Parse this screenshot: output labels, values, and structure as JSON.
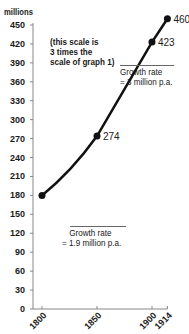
{
  "chart_data": {
    "type": "line",
    "title": "",
    "ylabel": "millions",
    "xlabel": "",
    "ylim": [
      0,
      460
    ],
    "yticks": [
      0,
      30,
      60,
      90,
      120,
      150,
      180,
      210,
      240,
      270,
      300,
      330,
      360,
      390,
      420,
      450
    ],
    "xticks": [
      "1800",
      "1850",
      "1900",
      "1914"
    ],
    "x": [
      1800,
      1850,
      1900,
      1914
    ],
    "series": [
      {
        "name": "Population",
        "values": [
          180,
          274,
          423,
          460
        ]
      }
    ],
    "point_labels": [
      "",
      "274",
      "423",
      "460"
    ],
    "annotations": [
      "(this scale is 3 times the scale of graph 1)",
      "Growth rate = 3 million p.a.",
      "Growth rate = 1.9 million p.a."
    ],
    "grid": false,
    "legend": "none"
  },
  "labels": {
    "unit": "millions",
    "note_line1": "(this scale is",
    "note_line2": "3 times the",
    "note_line3": "scale of graph 1)",
    "growth_hi_line1": "Growth rate",
    "growth_hi_line2": "= 3 million p.a.",
    "growth_lo_line1": "Growth rate",
    "growth_lo_line2": "= 1.9 million p.a."
  }
}
